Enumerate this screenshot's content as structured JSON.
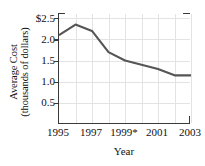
{
  "chart_data": {
    "type": "line",
    "title": "",
    "xlabel": "Year",
    "ylabel": "Average Cost (thousands of dollars)",
    "ylabel_line1": "Average Cost",
    "ylabel_line2": "(thousands of dollars)",
    "x": [
      1995,
      1996,
      1997,
      1998,
      1999,
      2000,
      2001,
      2002,
      2003
    ],
    "values": [
      2.1,
      2.35,
      2.2,
      1.7,
      1.5,
      1.4,
      1.3,
      1.15,
      1.15
    ],
    "series": [
      {
        "name": "Average Cost",
        "values": [
          2.1,
          2.35,
          2.2,
          1.7,
          1.5,
          1.4,
          1.3,
          1.15,
          1.15
        ]
      }
    ],
    "xlim": [
      1995,
      2003
    ],
    "ylim": [
      0.0,
      2.6
    ],
    "xticks": [
      1995,
      1997,
      1999,
      2001,
      2003
    ],
    "xtick_labels": [
      "1995",
      "1997",
      "1999*",
      "2001",
      "2003"
    ],
    "yticks": [
      0.5,
      1.0,
      1.5,
      2.0,
      2.5
    ],
    "ytick_labels": [
      "0.5",
      "1.0",
      "1.5",
      "2.0",
      "$2.5"
    ],
    "grid": true,
    "grid_axis": "both",
    "legend": "none",
    "line_color": "#555555",
    "grid_color": "#e3e3e3",
    "axis_color": "#3a3a3a",
    "annotations": [
      "* asterisk on 1999 tick label"
    ]
  }
}
